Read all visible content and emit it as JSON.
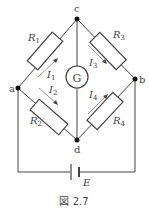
{
  "diagram": {
    "type": "wheatstone-bridge",
    "nodes": {
      "a": "a",
      "b": "b",
      "c": "c",
      "d": "d"
    },
    "resistors": {
      "r1": "R",
      "r1_sub": "1",
      "r2": "R",
      "r2_sub": "2",
      "r3": "R",
      "r3_sub": "3",
      "r4": "R",
      "r4_sub": "4"
    },
    "currents": {
      "i1": "I",
      "i1_sub": "1",
      "i2": "I",
      "i2_sub": "2",
      "i3": "I",
      "i3_sub": "3",
      "i4": "I",
      "i4_sub": "4"
    },
    "galvanometer": "G",
    "battery": "E",
    "caption": "図 2.7",
    "colors": {
      "line": "#444444",
      "node": "#111111",
      "arrow": "#999999"
    }
  }
}
